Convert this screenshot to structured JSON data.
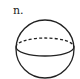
{
  "figure": {
    "label": "n.",
    "shape": "sphere",
    "stroke_color": "#222222",
    "background_color": "#ffffff",
    "sphere": {
      "cx": 45,
      "cy": 49,
      "r": 29
    },
    "equator": {
      "rx": 29,
      "ry": 9,
      "front_style": "solid",
      "back_style": "dashed"
    }
  }
}
